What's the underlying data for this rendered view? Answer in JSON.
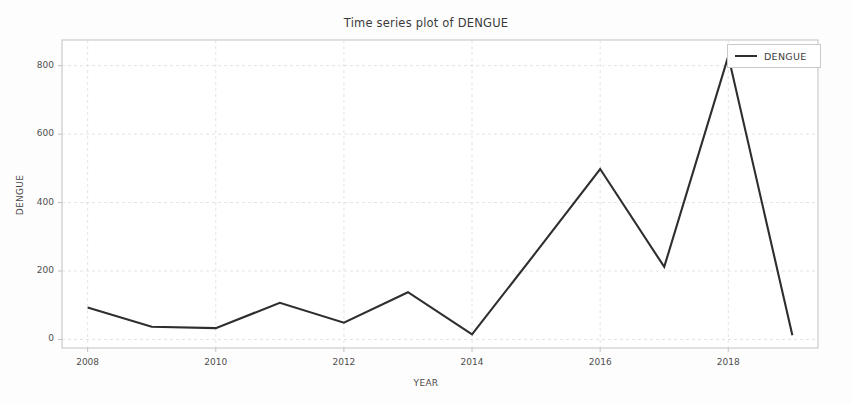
{
  "chart_data": {
    "type": "line",
    "title": "Time series plot of DENGUE",
    "xlabel": "YEAR",
    "ylabel": "DENGUE",
    "x": [
      2008,
      2009,
      2010,
      2011,
      2012,
      2013,
      2014,
      2015,
      2016,
      2017,
      2018,
      2019
    ],
    "values": [
      93,
      37,
      33,
      107,
      49,
      138,
      15,
      255,
      498,
      212,
      828,
      12
    ],
    "series": [
      {
        "name": "DENGUE",
        "values": [
          93,
          37,
          33,
          107,
          49,
          138,
          15,
          255,
          498,
          212,
          828,
          12
        ],
        "color": "#2e2e2e"
      }
    ],
    "xticks": [
      "2008",
      "2010",
      "2012",
      "2014",
      "2016",
      "2018"
    ],
    "xtick_values": [
      2008,
      2010,
      2012,
      2014,
      2016,
      2018
    ],
    "yticks": [
      "0",
      "200",
      "400",
      "600",
      "800"
    ],
    "ytick_values": [
      0,
      200,
      400,
      600,
      800
    ],
    "xlim": [
      2007.6,
      2019.4
    ],
    "ylim": [
      -25,
      875
    ],
    "grid": true,
    "legend_position": "top-right",
    "legend_entries": [
      "DENGUE"
    ]
  },
  "legend": {
    "label": "DENGUE"
  },
  "colors": {
    "line": "#2e2e2e",
    "grid": "#dcdcdc",
    "axis": "#c2c2c2",
    "background": "#fdfdfd",
    "text": "#3b3b3b"
  }
}
